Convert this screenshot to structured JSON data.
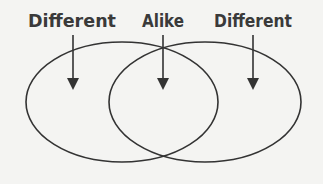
{
  "diagram": {
    "type": "venn",
    "labels": {
      "left": "Different",
      "middle": "Alike",
      "right": "Different"
    },
    "colors": {
      "stroke": "#333333",
      "text": "#3a3a3a",
      "background": "#f4f4f2"
    }
  }
}
